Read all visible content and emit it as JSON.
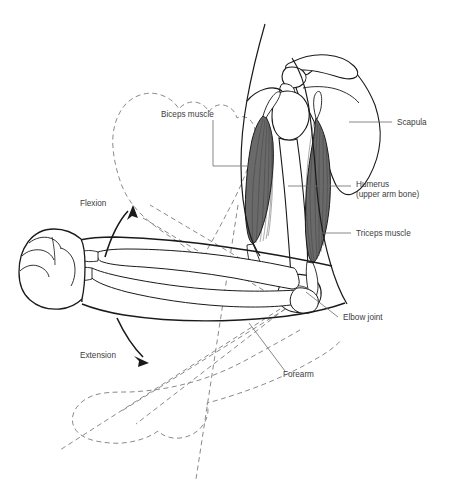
{
  "figure": {
    "background_color": "#ffffff",
    "line_color": "#1a1a1a",
    "muscle_fill_color": "#6a6a6a",
    "muscle_fiber_color": "#3a3a3a",
    "bone_fill_color": "#ffffff",
    "ghost_outline_color": "#8a8a8a",
    "label_color": "#3d3d3d",
    "leader_color": "#6b6b6b"
  },
  "labels": [
    {
      "id": "biceps",
      "text": "Biceps muscle",
      "x": 161,
      "y": 114,
      "anchor": "start"
    },
    {
      "id": "scapula",
      "text": "Scapula",
      "x": 397,
      "y": 125,
      "anchor": "start"
    },
    {
      "id": "humerus1",
      "text": "Humerus",
      "x": 356,
      "y": 187,
      "anchor": "start"
    },
    {
      "id": "humerus2",
      "text": "(upper arm bone)",
      "x": 356,
      "y": 197,
      "anchor": "start"
    },
    {
      "id": "triceps",
      "text": "Triceps muscle",
      "x": 356,
      "y": 236,
      "anchor": "start"
    },
    {
      "id": "elbow",
      "text": "Elbow joint",
      "x": 343,
      "y": 320,
      "anchor": "start"
    },
    {
      "id": "forearm",
      "text": "Forearm",
      "x": 283,
      "y": 377,
      "anchor": "start"
    },
    {
      "id": "flexion",
      "text": "Flexion",
      "x": 80,
      "y": 206,
      "anchor": "start"
    },
    {
      "id": "extension",
      "text": "Extension",
      "x": 80,
      "y": 358,
      "anchor": "start"
    }
  ],
  "anatomy_parts": [
    {
      "name": "Biceps muscle",
      "kind": "muscle"
    },
    {
      "name": "Triceps muscle",
      "kind": "muscle"
    },
    {
      "name": "Scapula",
      "kind": "bone"
    },
    {
      "name": "Humerus",
      "kind": "bone"
    },
    {
      "name": "Forearm",
      "kind": "bone"
    },
    {
      "name": "Elbow joint",
      "kind": "joint"
    },
    {
      "name": "Fist",
      "kind": "soft-tissue"
    }
  ],
  "motions": [
    {
      "name": "Flexion",
      "direction": "up"
    },
    {
      "name": "Extension",
      "direction": "down"
    }
  ]
}
